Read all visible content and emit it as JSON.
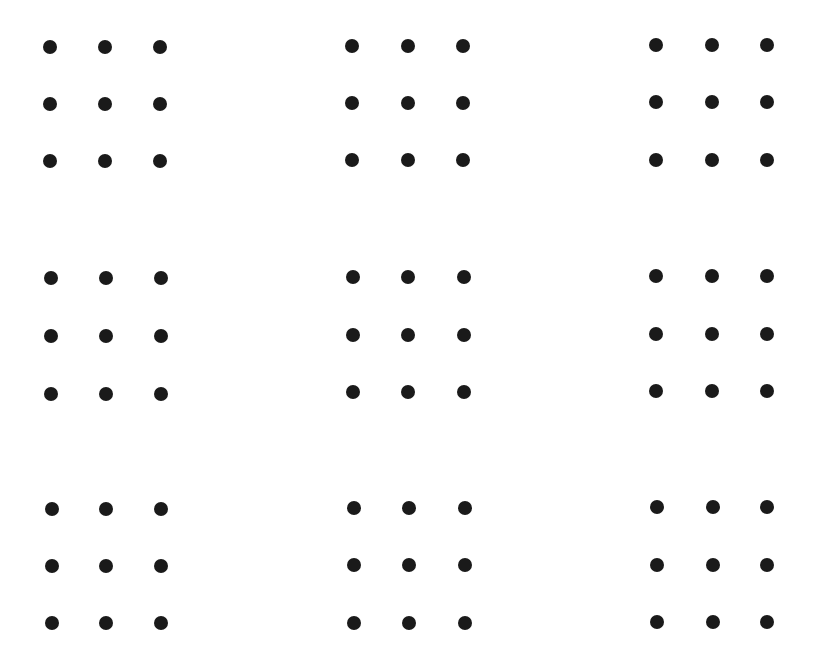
{
  "page": {
    "width": 819,
    "height": 654,
    "background": "#ffffff"
  },
  "style": {
    "dot_color": "#1a1a1a",
    "dot_diameter": 14
  },
  "puzzles": [
    {
      "id": "grid-1",
      "row": 1,
      "col": 1,
      "xs": [
        50,
        105,
        160
      ],
      "ys": [
        47,
        104,
        161
      ]
    },
    {
      "id": "grid-2",
      "row": 1,
      "col": 2,
      "xs": [
        352,
        408,
        463
      ],
      "ys": [
        46,
        103,
        160
      ]
    },
    {
      "id": "grid-3",
      "row": 1,
      "col": 3,
      "xs": [
        656,
        712,
        767
      ],
      "ys": [
        45,
        102,
        160
      ]
    },
    {
      "id": "grid-4",
      "row": 2,
      "col": 1,
      "xs": [
        51,
        106,
        161
      ],
      "ys": [
        278,
        336,
        394
      ]
    },
    {
      "id": "grid-5",
      "row": 2,
      "col": 2,
      "xs": [
        353,
        408,
        464
      ],
      "ys": [
        277,
        335,
        392
      ]
    },
    {
      "id": "grid-6",
      "row": 2,
      "col": 3,
      "xs": [
        656,
        712,
        767
      ],
      "ys": [
        276,
        334,
        391
      ]
    },
    {
      "id": "grid-7",
      "row": 3,
      "col": 1,
      "xs": [
        52,
        106,
        161
      ],
      "ys": [
        509,
        566,
        623
      ]
    },
    {
      "id": "grid-8",
      "row": 3,
      "col": 2,
      "xs": [
        354,
        409,
        465
      ],
      "ys": [
        508,
        565,
        623
      ]
    },
    {
      "id": "grid-9",
      "row": 3,
      "col": 3,
      "xs": [
        657,
        713,
        767
      ],
      "ys": [
        507,
        565,
        622
      ]
    }
  ]
}
